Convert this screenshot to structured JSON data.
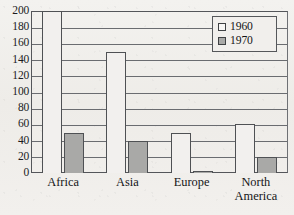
{
  "chart_data": {
    "type": "bar",
    "title": "",
    "subtitle": "",
    "xlabel": "",
    "ylabel": "",
    "categories": [
      "Africa",
      "Asia",
      "Europe",
      "North America"
    ],
    "category_lines": [
      [
        "Africa"
      ],
      [
        "Asia"
      ],
      [
        "Europe"
      ],
      [
        "North",
        "America"
      ]
    ],
    "series": [
      {
        "name": "1960",
        "values": [
          200,
          150,
          50,
          60
        ],
        "color": "#f2f0ee",
        "style": "outlined"
      },
      {
        "name": "1970",
        "values": [
          50,
          40,
          3,
          20
        ],
        "color": "#a9a9a7",
        "style": "filled"
      }
    ],
    "ylim": [
      0,
      200
    ],
    "ytick_step": 20,
    "yticks": [
      200,
      180,
      160,
      140,
      120,
      100,
      80,
      60,
      40,
      20,
      0
    ],
    "ytick_labels": [
      "200",
      "180",
      "160",
      "140",
      "120",
      "100",
      "80",
      "60",
      "40",
      "20",
      "0"
    ],
    "grid": true,
    "grid_axis": "y",
    "legend": {
      "position": "top-right",
      "boxed": true,
      "entries": [
        "1960",
        "1970"
      ]
    }
  },
  "colors": {
    "bar_1960_fill": "#f2f0ee",
    "bar_1970_fill": "#a9a9a7",
    "outline": "#4f5154",
    "gridline": "#6a6c70",
    "text": "#141517",
    "background": "#f0eeea"
  }
}
